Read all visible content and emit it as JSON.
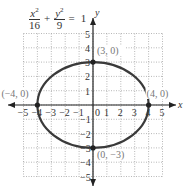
{
  "equation": {
    "term1_num": "x",
    "term1_exp": "2",
    "term1_den": "16",
    "plus": "+",
    "term2_num": "y",
    "term2_exp": "2",
    "term2_den": "9",
    "equals": "=",
    "rhs": "1"
  },
  "chart_data": {
    "type": "line",
    "xlabel": "x",
    "ylabel": "y",
    "xlim": [
      -5,
      5
    ],
    "ylim": [
      -5,
      5
    ],
    "grid": true,
    "x_ticks": [
      "-5",
      "-4",
      "-3",
      "-2",
      "-1",
      "0",
      "1",
      "2",
      "3",
      "4",
      "5"
    ],
    "y_ticks": [
      "5",
      "4",
      "3",
      "2",
      "1",
      "-1",
      "-2",
      "-3",
      "-4",
      "-5"
    ],
    "curve": {
      "shape": "ellipse",
      "center": [
        0,
        0
      ],
      "a": 4,
      "b": 3
    },
    "points": [
      {
        "x": 0,
        "y": 3,
        "label": "(3, 0)"
      },
      {
        "x": 4,
        "y": 0,
        "label": "(4, 0)"
      },
      {
        "x": -4,
        "y": 0,
        "label": "(−4, 0)"
      },
      {
        "x": 0,
        "y": -3,
        "label": "(0, −3)"
      }
    ],
    "colors": {
      "curve": "#3a3a3a",
      "axis": "#222222",
      "grid": "#9a9a9a",
      "label": "#777777"
    }
  }
}
